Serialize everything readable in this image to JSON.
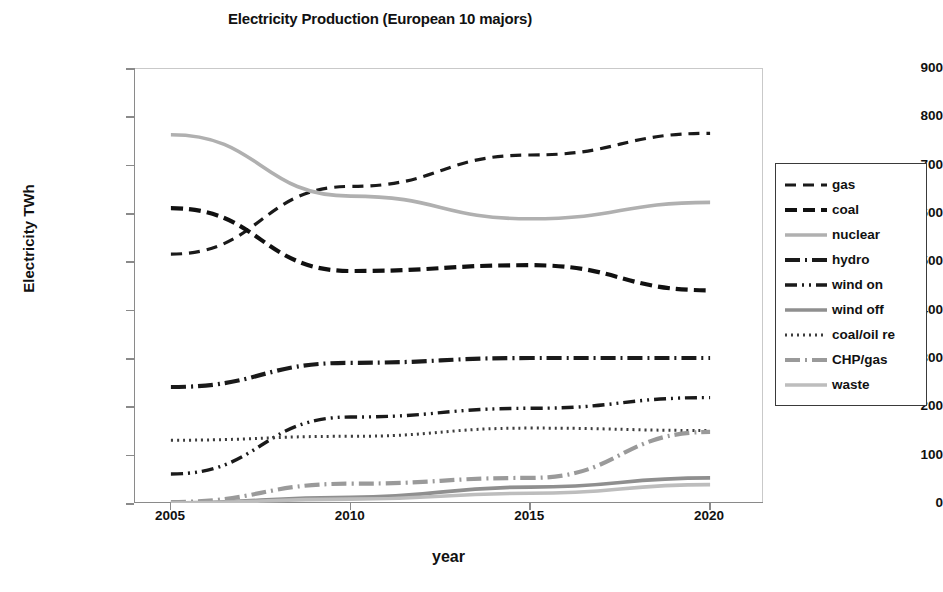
{
  "chart_data": {
    "type": "line",
    "title": "Electricity Production (European 10 majors)",
    "xlabel": "year",
    "ylabel": "Electricity TWh",
    "x": [
      2005,
      2010,
      2015,
      2020
    ],
    "xticks": [
      "2005",
      "2010",
      "2015",
      "2020"
    ],
    "yticks": [
      "0",
      "100",
      "200",
      "300",
      "400",
      "500",
      "600",
      "700",
      "800",
      "900"
    ],
    "xlim": [
      2004,
      2021.5
    ],
    "ylim": [
      0,
      900
    ],
    "grid": false,
    "legend_position": "right",
    "series": [
      {
        "name": "gas",
        "values": [
          515,
          655,
          720,
          765
        ],
        "color": "#1a1a1a",
        "dash": "dashed"
      },
      {
        "name": "coal",
        "values": [
          610,
          480,
          492,
          440
        ],
        "color": "#111111",
        "dash": "dashed-thick"
      },
      {
        "name": "nuclear",
        "values": [
          762,
          635,
          588,
          622
        ],
        "color": "#b0b0b0",
        "dash": "solid"
      },
      {
        "name": "hydro",
        "values": [
          240,
          290,
          300,
          300
        ],
        "color": "#1a1a1a",
        "dash": "dash-dot"
      },
      {
        "name": "wind on",
        "values": [
          60,
          178,
          196,
          218
        ],
        "color": "#1a1a1a",
        "dash": "dash-dot-dot"
      },
      {
        "name": "wind off",
        "values": [
          0,
          12,
          33,
          52
        ],
        "color": "#8f8f8f",
        "dash": "solid"
      },
      {
        "name": "coal/oil re",
        "values": [
          130,
          138,
          155,
          150
        ],
        "color": "#3d3d3d",
        "dash": "dotted"
      },
      {
        "name": "CHP/gas",
        "values": [
          2,
          40,
          52,
          147
        ],
        "color": "#9a9a9a",
        "dash": "dash-dot"
      },
      {
        "name": "waste",
        "values": [
          0,
          8,
          20,
          38
        ],
        "color": "#bdbdbd",
        "dash": "solid"
      }
    ]
  }
}
